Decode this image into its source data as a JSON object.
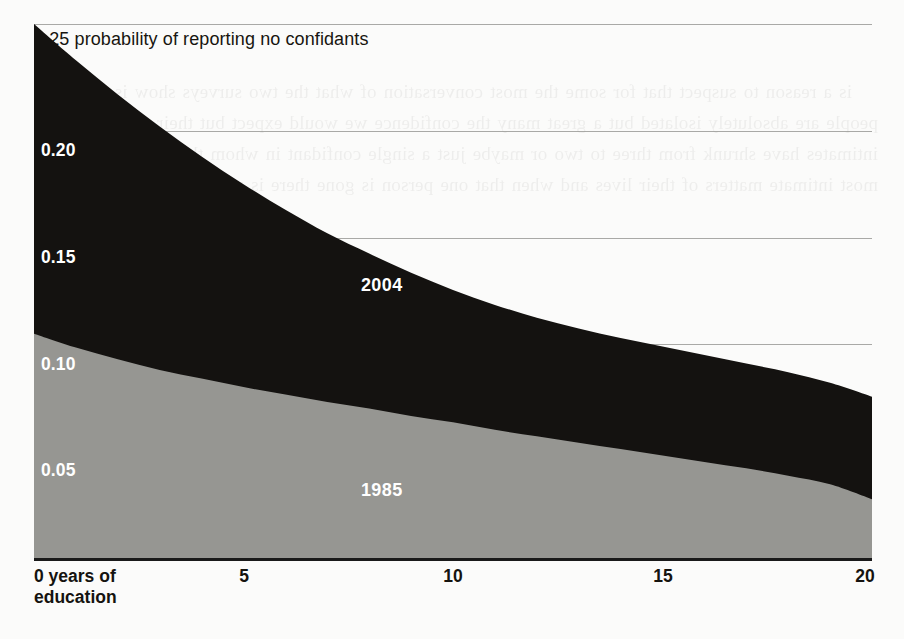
{
  "figure": {
    "headline": "0.25 probability of reporting no confidants",
    "origin_label": "0 years of\neducation",
    "ink": "#17150f",
    "gridline_color": "#9a9a96",
    "background": "#fbfbfa"
  },
  "page_bleed_text": "is a reason to suspect that for some the most conversation of what the two surveys show is not of people are absolutely isolated but a great many the confidence we would expect but their circles of intimates have shrunk from three to two or maybe just a single confidant in whom they can confide the most intimate matters of their lives and when that one person is gone there is no one left at all",
  "chart_data": {
    "type": "area",
    "stacked": true,
    "title": "0.25 probability of reporting no confidants",
    "xlabel": "0 years of education",
    "ylabel": "probability of reporting no confidants",
    "xlim": [
      0,
      20
    ],
    "ylim": [
      0,
      0.25
    ],
    "grid": true,
    "legend": "in-chart labels",
    "xticks": [
      {
        "value": 0,
        "label": "0 years of\neducation"
      },
      {
        "value": 5,
        "label": "5"
      },
      {
        "value": 10,
        "label": "10"
      },
      {
        "value": 15,
        "label": "15"
      },
      {
        "value": 20,
        "label": "20"
      }
    ],
    "yticks": [
      {
        "value": 0.25,
        "label": "0.25",
        "inside": false
      },
      {
        "value": 0.2,
        "label": "0.20",
        "inside": true
      },
      {
        "value": 0.15,
        "label": "0.15",
        "inside": true
      },
      {
        "value": 0.1,
        "label": "0.10",
        "inside": true
      },
      {
        "value": 0.05,
        "label": "0.05",
        "inside": true
      }
    ],
    "x": [
      0,
      1,
      2,
      3,
      4,
      5,
      6,
      7,
      8,
      9,
      10,
      11,
      12,
      13,
      14,
      15,
      16,
      17,
      18,
      19,
      20
    ],
    "series": [
      {
        "name": "2004",
        "color": "#141210",
        "label_x": 8.3,
        "label_y": 0.128,
        "total_values": [
          0.25,
          0.233,
          0.217,
          0.202,
          0.188,
          0.175,
          0.163,
          0.152,
          0.1425,
          0.1335,
          0.1255,
          0.1185,
          0.1125,
          0.1075,
          0.103,
          0.099,
          0.095,
          0.091,
          0.087,
          0.082,
          0.0755
        ]
      },
      {
        "name": "1985",
        "color": "#969692",
        "label_x": 8.3,
        "label_y": 0.032,
        "total_values": [
          0.105,
          0.0985,
          0.093,
          0.088,
          0.084,
          0.08,
          0.0765,
          0.073,
          0.07,
          0.0665,
          0.0635,
          0.06,
          0.057,
          0.054,
          0.051,
          0.048,
          0.045,
          0.042,
          0.0385,
          0.0345,
          0.0275
        ]
      }
    ]
  }
}
